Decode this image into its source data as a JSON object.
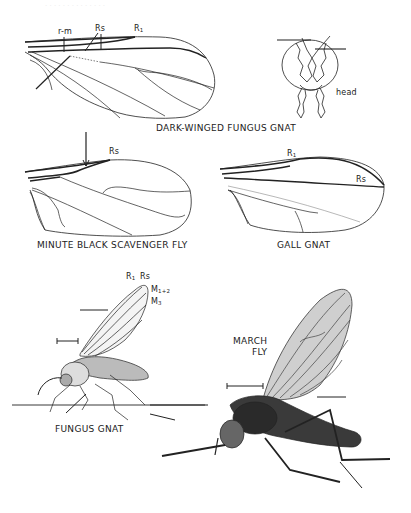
{
  "page": {
    "bleed_text": "· · ·  · · · ·  · · · · · · ·"
  },
  "figures": [
    {
      "id": "dark-winged-fungus-gnat",
      "caption": "DARK-WINGED FUNGUS GNAT",
      "labels": {
        "rm": "r-m",
        "rs": "Rs",
        "r1": "R",
        "r1_sub": "1"
      },
      "inset_label": "head"
    },
    {
      "id": "minute-black-scavenger-fly",
      "caption": "MINUTE BLACK SCAVENGER FLY",
      "labels": {
        "rs": "Rs"
      }
    },
    {
      "id": "gall-gnat",
      "caption": "GALL GNAT",
      "labels": {
        "r1": "R",
        "r1_sub": "1",
        "rs": "Rs"
      }
    },
    {
      "id": "fungus-gnat",
      "caption": "FUNGUS GNAT",
      "labels": {
        "r1": "R",
        "r1_sub": "1",
        "rs": "Rs",
        "m12": "M",
        "m12_sub": "1+2",
        "m3": "M",
        "m3_sub": "3"
      }
    },
    {
      "id": "march-fly",
      "caption_line1": "MARCH",
      "caption_line2": "FLY"
    }
  ],
  "colors": {
    "ink": "#222222",
    "background": "#ffffff",
    "shade": "#555555"
  }
}
